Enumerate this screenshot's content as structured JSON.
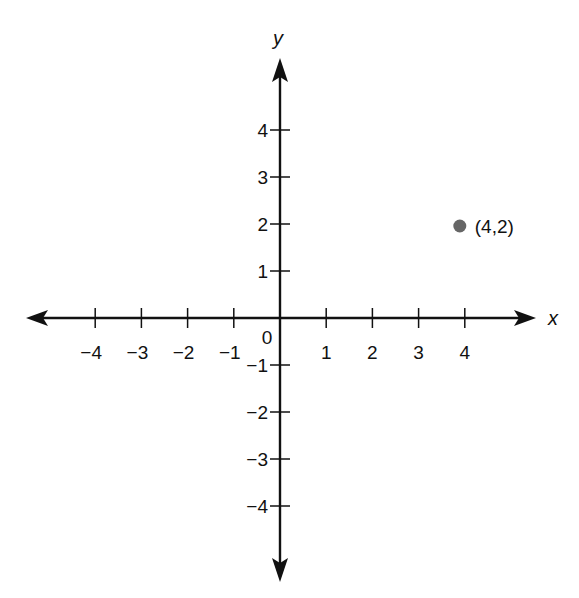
{
  "chart_data": {
    "type": "scatter",
    "title": "",
    "xlabel": "x",
    "ylabel": "y",
    "xlim": [
      -5,
      5
    ],
    "ylim": [
      -5,
      5
    ],
    "grid": false,
    "x_ticks": [
      -4,
      -3,
      -2,
      -1,
      1,
      2,
      3,
      4
    ],
    "y_ticks": [
      -4,
      -3,
      -2,
      -1,
      1,
      2,
      3,
      4
    ],
    "x_tick_labels": [
      "−4",
      "−3",
      "−2",
      "−1",
      "1",
      "2",
      "3",
      "4"
    ],
    "y_tick_labels": [
      "−4",
      "−3",
      "−2",
      "−1",
      "1",
      "2",
      "3",
      "4"
    ],
    "origin_label": "0",
    "points": [
      {
        "x": 4,
        "y": 2,
        "label": "(4,2)",
        "color": "#666666"
      }
    ]
  },
  "colors": {
    "axis": "#111111",
    "point": "#666666"
  }
}
